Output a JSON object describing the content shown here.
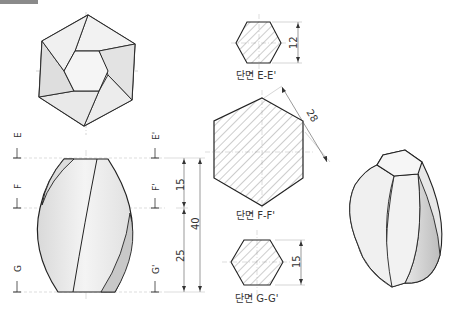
{
  "header_bar": {
    "color": "#8a8a8a"
  },
  "views": {
    "top_view": {
      "name": "top view (hexagon, twisted)"
    },
    "front_view": {
      "name": "front view"
    },
    "iso_view": {
      "name": "isometric view"
    }
  },
  "section_markers": {
    "left": [
      "E",
      "F",
      "G"
    ],
    "right": [
      "E'",
      "F'",
      "G'"
    ]
  },
  "dimensions": {
    "upper": "15",
    "lower": "25",
    "total": "40"
  },
  "sections": [
    {
      "label": "단면 E-E'",
      "dim": "12"
    },
    {
      "label": "단면 F-F'",
      "dim": "28"
    },
    {
      "label": "단면 G-G'",
      "dim": "15"
    }
  ],
  "colors": {
    "line": "#222222",
    "face_light": "#f3f3f3",
    "face_mid": "#e4e4e4",
    "face_dark": "#cfcfcf",
    "center_line": "#999999",
    "hatch": "#555555"
  }
}
